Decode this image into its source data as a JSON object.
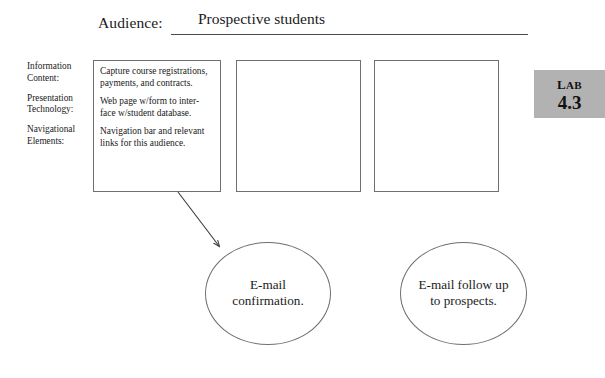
{
  "header": {
    "label": "Audience:",
    "value": "Prospective students"
  },
  "side_labels": [
    "Information\nContent:",
    "Presentation\nTechnology:",
    "Navigational\nElements:"
  ],
  "boxes": [
    {
      "paragraphs": [
        "Capture course registrations, payments, and contracts.",
        "Web page w/form to inter-face w/student database.",
        "Navigation bar and relevant links for this audience."
      ]
    },
    {
      "paragraphs": []
    },
    {
      "paragraphs": []
    }
  ],
  "circles": [
    {
      "text": "E-mail\nconfirmation."
    },
    {
      "text": "E-mail follow up\nto prospects."
    }
  ],
  "badge": {
    "word": "Lab",
    "number": "4.3",
    "background": "#b2b2b2"
  },
  "connector": {
    "from_x": 178,
    "from_y": 192,
    "to_x": 219,
    "to_y": 246,
    "color": "#3a3a3a"
  },
  "colors": {
    "page_background": "#ffffff",
    "ink": "#1a1a1a",
    "stroke": "#6f6f6f",
    "rule": "#4a4a4a"
  }
}
